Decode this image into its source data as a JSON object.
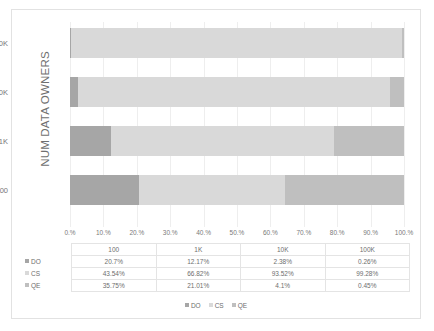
{
  "chart_data": {
    "type": "bar",
    "subtype": "100% stacked horizontal bar",
    "title": "",
    "xlabel": "",
    "ylabel": "NUM DATA OWNERS",
    "categories": [
      "100",
      "1K",
      "10K",
      "100K"
    ],
    "categories_display_top_to_bottom": [
      "100K",
      "10K",
      "1K",
      "100"
    ],
    "series": [
      {
        "name": "DO",
        "color": "#a6a6a6",
        "values": [
          20.7,
          12.17,
          2.38,
          0.26
        ],
        "labels": [
          "20.7%",
          "12.17%",
          "2.38%",
          "0.26%"
        ]
      },
      {
        "name": "CS",
        "color": "#d9d9d9",
        "values": [
          43.54,
          66.82,
          93.52,
          99.28
        ],
        "labels": [
          "43.54%",
          "66.82%",
          "93.52%",
          "99.28%"
        ]
      },
      {
        "name": "QE",
        "color": "#bfbfbf",
        "values": [
          35.75,
          21.01,
          4.1,
          0.45
        ],
        "labels": [
          "35.75%",
          "21.01%",
          "4.1%",
          "0.45%"
        ]
      }
    ],
    "xlim": [
      0,
      100
    ],
    "x_ticks": [
      "0.%",
      "10.%",
      "20.%",
      "30.%",
      "40.%",
      "50.%",
      "60.%",
      "70.%",
      "80.%",
      "90.%",
      "100.%"
    ],
    "grid": true,
    "legend_position": "bottom",
    "legend_entries": [
      "DO",
      "CS",
      "QE"
    ],
    "data_table_shown": true
  },
  "axis": {
    "y_title": "NUM DATA OWNERS",
    "y_categories_top_to_bottom": [
      "100K",
      "10K",
      "1K",
      "100"
    ],
    "x_ticks": [
      "0.%",
      "10.%",
      "20.%",
      "30.%",
      "40.%",
      "50.%",
      "60.%",
      "70.%",
      "80.%",
      "90.%",
      "100.%"
    ]
  },
  "table": {
    "column_headers": [
      "100",
      "1K",
      "10K",
      "100K"
    ],
    "rows": [
      {
        "label": "DO",
        "swatch": "do-swatch",
        "cells": [
          "20.7%",
          "12.17%",
          "2.38%",
          "0.26%"
        ]
      },
      {
        "label": "CS",
        "swatch": "cs-swatch",
        "cells": [
          "43.54%",
          "66.82%",
          "93.52%",
          "99.28%"
        ]
      },
      {
        "label": "QE",
        "swatch": "qe-swatch",
        "cells": [
          "35.75%",
          "21.01%",
          "4.1%",
          "0.45%"
        ]
      }
    ]
  },
  "legend": {
    "items": [
      {
        "label": "DO",
        "color": "#a6a6a6"
      },
      {
        "label": "CS",
        "color": "#d9d9d9"
      },
      {
        "label": "QE",
        "color": "#bfbfbf"
      }
    ]
  },
  "colors": {
    "do": "#a6a6a6",
    "cs": "#d9d9d9",
    "qe": "#bfbfbf",
    "gridline": "#eeeeee",
    "border": "#e2e2e2",
    "text": "#6e6e6e"
  }
}
